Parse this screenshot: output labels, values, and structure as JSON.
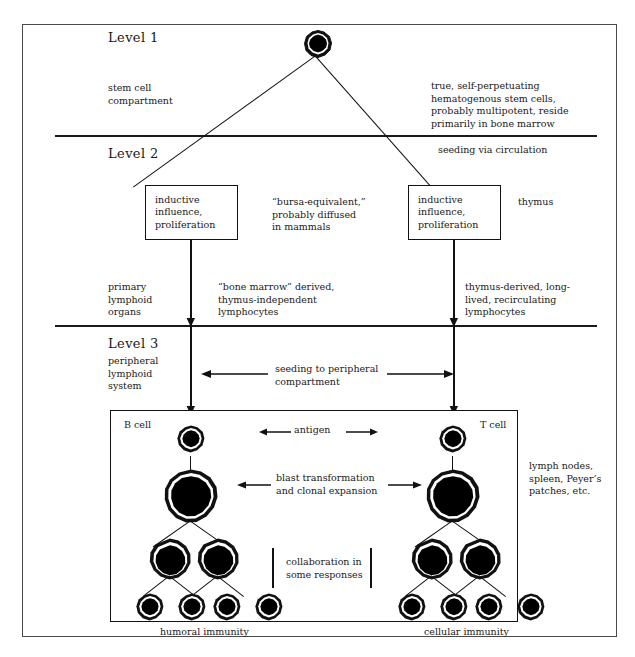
{
  "figure": {
    "levels": [
      {
        "id": "level-1",
        "label": "Level 1"
      },
      {
        "id": "level-2",
        "label": "Level 2"
      },
      {
        "id": "level-3",
        "label": "Level 3",
        "sublabel": "peripheral\nlymphoid\nsystem"
      }
    ],
    "notes": {
      "stem_cell_compartment": "stem cell\ncompartment",
      "stem_cell_description": "true, self-perpetuating\nhematogenous stem cells,\nprobably multipotent, reside\nprimarily in bone marrow",
      "seeding_via_circulation": "seeding via circulation",
      "bursa_equivalent": "“bursa-equivalent,”\nprobably diffused\nin mammals",
      "thymus": "thymus",
      "primary_lymphoid_organs": "primary\nlymphoid\norgans",
      "bone_marrow_derived": "“bone marrow” derived,\nthymus-independent\nlymphocytes",
      "thymus_derived": "thymus-derived, long-\nlived, recirculating\nlymphocytes",
      "seeding_to_peripheral": "seeding to peripheral\ncompartment",
      "lymphoid_tissues": "lymph nodes,\nspleen, Peyer’s\npatches, etc.",
      "antigen": "antigen",
      "blast_transformation": "blast transformation\nand clonal expansion",
      "collaboration": "collaboration in\nsome responses"
    },
    "boxes": [
      {
        "id": "inductive-box-left",
        "text": "inductive\ninfluence,\nproliferation"
      },
      {
        "id": "inductive-box-right",
        "text": "inductive\ninfluence,\nproliferation"
      }
    ],
    "cell_lineages": [
      {
        "id": "b-cell",
        "label": "B cell",
        "outcome": "humoral immunity"
      },
      {
        "id": "t-cell",
        "label": "T cell",
        "outcome": "cellular immunity"
      }
    ],
    "colors": {
      "ink": "#1a1a1a",
      "rule": "#111111",
      "frame": "#4a4a4a",
      "background": "#ffffff",
      "cell_fill": "#000000",
      "cell_ring": "#ffffff"
    }
  }
}
